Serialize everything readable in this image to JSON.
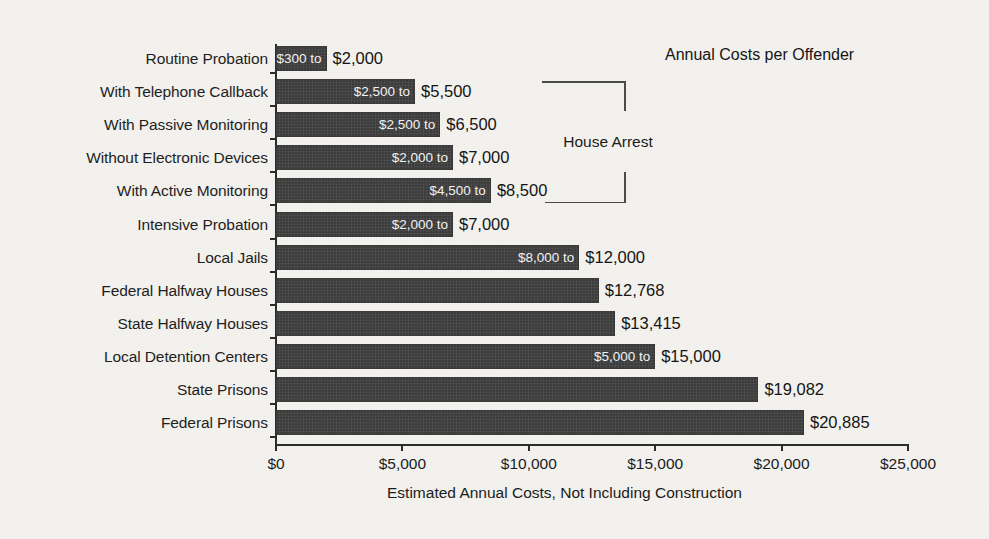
{
  "chart_data": {
    "type": "bar",
    "orientation": "horizontal",
    "title": "Annual Costs per Offender",
    "xlabel": "Estimated Annual Costs, Not Including Construction",
    "ylabel": "",
    "xlim": [
      0,
      25000
    ],
    "grid": false,
    "xticks": [
      0,
      5000,
      10000,
      15000,
      20000,
      25000
    ],
    "xticklabels": [
      "$0",
      "$5,000",
      "$10,000",
      "$15,000",
      "$20,000",
      "$25,000"
    ],
    "categories": [
      "Routine Probation",
      "With Telephone Callback",
      "With Passive Monitoring",
      "Without Electronic Devices",
      "With Active Monitoring",
      "Intensive Probation",
      "Local Jails",
      "Federal Halfway Houses",
      "State Halfway Houses",
      "Local Detention Centers",
      "State Prisons",
      "Federal Prisons"
    ],
    "values": [
      2000,
      5500,
      6500,
      7000,
      8500,
      7000,
      12000,
      12768,
      13415,
      15000,
      19082,
      20885
    ],
    "low_values": [
      300,
      2500,
      2500,
      2000,
      4500,
      2000,
      8000,
      null,
      null,
      5000,
      null,
      null
    ],
    "bars": [
      {
        "category": "Routine Probation",
        "low": 300,
        "high": 2000,
        "inside_label": "$300 to",
        "outside_label": "$2,000"
      },
      {
        "category": "With Telephone Callback",
        "low": 2500,
        "high": 5500,
        "inside_label": "$2,500 to",
        "outside_label": "$5,500"
      },
      {
        "category": "With Passive Monitoring",
        "low": 2500,
        "high": 6500,
        "inside_label": "$2,500 to",
        "outside_label": "$6,500"
      },
      {
        "category": "Without Electronic Devices",
        "low": 2000,
        "high": 7000,
        "inside_label": "$2,000 to",
        "outside_label": "$7,000"
      },
      {
        "category": "With Active Monitoring",
        "low": 4500,
        "high": 8500,
        "inside_label": "$4,500 to",
        "outside_label": "$8,500"
      },
      {
        "category": "Intensive Probation",
        "low": 2000,
        "high": 7000,
        "inside_label": "$2,000 to",
        "outside_label": "$7,000"
      },
      {
        "category": "Local Jails",
        "low": 8000,
        "high": 12000,
        "inside_label": "$8,000 to",
        "outside_label": "$12,000"
      },
      {
        "category": "Federal Halfway Houses",
        "low": null,
        "high": 12768,
        "inside_label": "",
        "outside_label": "$12,768"
      },
      {
        "category": "State Halfway Houses",
        "low": null,
        "high": 13415,
        "inside_label": "",
        "outside_label": "$13,415"
      },
      {
        "category": "Local Detention Centers",
        "low": 5000,
        "high": 15000,
        "inside_label": "$5,000 to",
        "outside_label": "$15,000"
      },
      {
        "category": "State Prisons",
        "low": null,
        "high": 19082,
        "inside_label": "",
        "outside_label": "$19,082"
      },
      {
        "category": "Federal Prisons",
        "low": null,
        "high": 20885,
        "inside_label": "",
        "outside_label": "$20,885"
      }
    ],
    "annotations": [
      {
        "label": "House Arrest",
        "spans": [
          "With Telephone Callback",
          "With Passive Monitoring",
          "Without Electronic Devices",
          "With Active Monitoring"
        ]
      }
    ],
    "colors": {
      "bar": "#3b3b3b",
      "background": "#f4f2ee",
      "axis": "#2b2b2b",
      "text": "#1a1a1a",
      "inside_label_text": "#f3f3f3"
    }
  }
}
